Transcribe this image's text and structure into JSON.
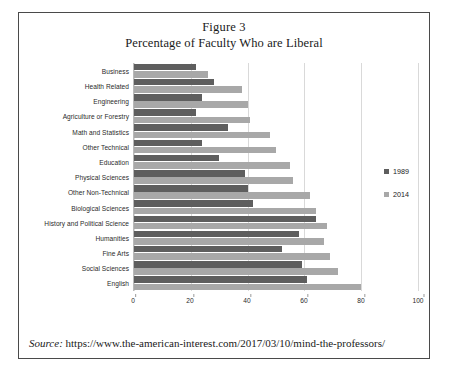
{
  "figure": {
    "title_line1": "Figure 3",
    "title_line2": "Percentage of Faculty Who are Liberal"
  },
  "source": {
    "label": "Source:",
    "url": "https://www.the-american-interest.com/2017/03/10/mind-the-professors/"
  },
  "legend": {
    "position": "right",
    "items": [
      {
        "label": "1989",
        "color": "#5e5e5e"
      },
      {
        "label": "2014",
        "color": "#a8a8a8"
      }
    ]
  },
  "chart_data": {
    "type": "bar",
    "orientation": "horizontal",
    "title": "Percentage of Faculty Who are Liberal",
    "xlabel": "",
    "ylabel": "",
    "xlim": [
      0,
      100
    ],
    "xticks": [
      0,
      20,
      40,
      60,
      80,
      100
    ],
    "grid": true,
    "legend_position": "right",
    "categories": [
      "Business",
      "Health Related",
      "Engineering",
      "Agriculture or Forestry",
      "Math and Statistics",
      "Other Technical",
      "Education",
      "Physical Sciences",
      "Other Non-Technical",
      "Biological Sciences",
      "History and Political Science",
      "Humanities",
      "Fine Arts",
      "Social Sciences",
      "English"
    ],
    "series": [
      {
        "name": "1989",
        "color": "#5e5e5e",
        "values": [
          22,
          28,
          24,
          22,
          33,
          24,
          30,
          39,
          40,
          42,
          64,
          58,
          52,
          59,
          61
        ]
      },
      {
        "name": "2014",
        "color": "#a8a8a8",
        "values": [
          26,
          38,
          40,
          41,
          48,
          50,
          55,
          56,
          62,
          64,
          68,
          67,
          69,
          72,
          80
        ]
      }
    ]
  }
}
